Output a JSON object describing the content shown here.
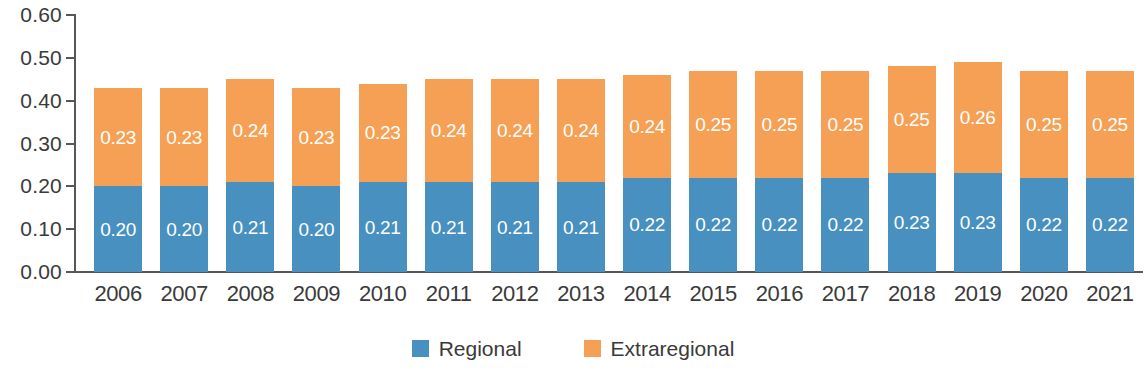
{
  "chart_data": {
    "type": "bar",
    "subtype": "stacked-bar",
    "title": "",
    "subtitle": "",
    "xlabel": "",
    "ylabel": "",
    "ylim": [
      0,
      0.6
    ],
    "ytick_values": [
      0.6,
      0.5,
      0.4,
      0.3,
      0.2,
      0.1,
      0.0
    ],
    "ytick_labels": [
      "0.60",
      "0.50",
      "0.40",
      "0.30",
      "0.20",
      "0.10",
      "0.00"
    ],
    "grid": false,
    "legend_position": "bottom-center",
    "categories": [
      "2006",
      "2007",
      "2008",
      "2009",
      "2010",
      "2011",
      "2012",
      "2013",
      "2014",
      "2015",
      "2016",
      "2017",
      "2018",
      "2019",
      "2020",
      "2021"
    ],
    "series": [
      {
        "name": "Regional",
        "color": "#4790c0",
        "values": [
          0.2,
          0.2,
          0.21,
          0.2,
          0.21,
          0.21,
          0.21,
          0.21,
          0.22,
          0.22,
          0.22,
          0.22,
          0.23,
          0.23,
          0.22,
          0.22
        ],
        "labels": [
          "0.20",
          "0.20",
          "0.21",
          "0.20",
          "0.21",
          "0.21",
          "0.21",
          "0.21",
          "0.22",
          "0.22",
          "0.22",
          "0.22",
          "0.23",
          "0.23",
          "0.22",
          "0.22"
        ]
      },
      {
        "name": "Extraregional",
        "color": "#f5a054",
        "values": [
          0.23,
          0.23,
          0.24,
          0.23,
          0.23,
          0.24,
          0.24,
          0.24,
          0.24,
          0.25,
          0.25,
          0.25,
          0.25,
          0.26,
          0.25,
          0.25
        ],
        "labels": [
          "0.23",
          "0.23",
          "0.24",
          "0.23",
          "0.23",
          "0.24",
          "0.24",
          "0.24",
          "0.24",
          "0.25",
          "0.25",
          "0.25",
          "0.25",
          "0.26",
          "0.25",
          "0.25"
        ]
      }
    ],
    "totals": [
      0.43,
      0.44,
      0.45,
      0.44,
      0.45,
      0.45,
      0.45,
      0.45,
      0.46,
      0.47,
      0.47,
      0.47,
      0.48,
      0.49,
      0.47,
      0.48
    ]
  },
  "legend": {
    "items": [
      {
        "label": "Regional",
        "color": "#4790c0"
      },
      {
        "label": "Extraregional",
        "color": "#f5a054"
      }
    ]
  },
  "axis": {
    "axis_color": "#575757"
  }
}
